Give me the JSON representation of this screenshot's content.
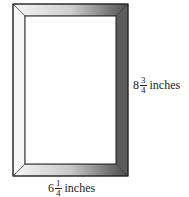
{
  "diagram": {
    "height_label": {
      "whole": "8",
      "numerator": "3",
      "denominator": "4",
      "unit": "inches"
    },
    "width_label": {
      "whole": "6",
      "numerator": "1",
      "denominator": "4",
      "unit": "inches"
    },
    "colors": {
      "frame_light": "#f4f4f4",
      "frame_dark": "#5a5a5a",
      "outline": "#222222"
    }
  }
}
